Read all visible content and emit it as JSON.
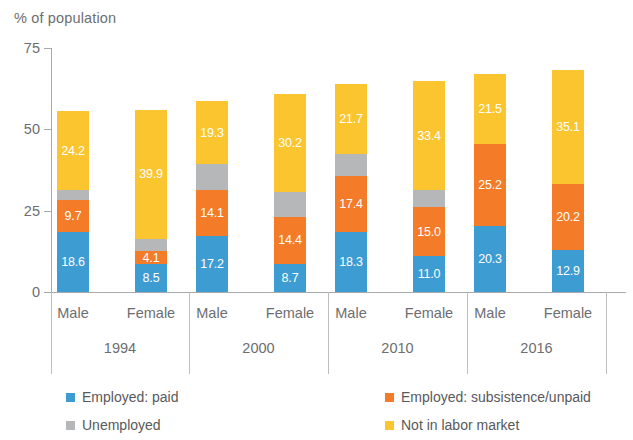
{
  "axis_title": "% of population",
  "legend": [
    {
      "label": "Employed: paid",
      "color": "#3d9cd2"
    },
    {
      "label": "Employed: subsistence/unpaid",
      "color": "#f47b28"
    },
    {
      "label": "Unemployed",
      "color": "#b5b7b9"
    },
    {
      "label": "Not in labor market",
      "color": "#fbc530"
    }
  ],
  "y_ticks": [
    "0",
    "25",
    "50",
    "75"
  ],
  "groups": [
    {
      "year": "1994",
      "subgroups": [
        "Male",
        "Female"
      ]
    },
    {
      "year": "2000",
      "subgroups": [
        "Male",
        "Female"
      ]
    },
    {
      "year": "2010",
      "subgroups": [
        "Male",
        "Female"
      ]
    },
    {
      "year": "2016",
      "subgroups": [
        "Male",
        "Female"
      ]
    }
  ],
  "chart_data": {
    "type": "bar",
    "title": "",
    "subtitle": "",
    "xlabel": "",
    "ylabel": "% of population",
    "ylim": [
      0,
      75
    ],
    "yticks": [
      0,
      25,
      50,
      75
    ],
    "grid": false,
    "stacked": true,
    "legend_position": "bottom",
    "categories": [
      "1994 Male",
      "1994 Female",
      "2000 Male",
      "2000 Female",
      "2010 Male",
      "2010 Female",
      "2016 Male",
      "2016 Female"
    ],
    "group_labels": [
      "1994",
      "2000",
      "2010",
      "2016"
    ],
    "subgroup_labels": [
      "Male",
      "Female"
    ],
    "series": [
      {
        "name": "Employed: paid",
        "color": "#3d9cd2",
        "values": [
          18.6,
          8.5,
          17.2,
          8.7,
          18.3,
          11.0,
          20.3,
          12.9
        ],
        "labels": [
          "18.6",
          "8.5",
          "17.2",
          "8.7",
          "18.3",
          "11.0",
          "20.3",
          "12.9"
        ]
      },
      {
        "name": "Employed: subsistence/unpaid",
        "color": "#f47b28",
        "values": [
          9.7,
          4.1,
          14.1,
          14.4,
          17.4,
          15.0,
          25.2,
          20.2
        ],
        "labels": [
          "9.7",
          "4.1",
          "14.1",
          "14.4",
          "17.4",
          "15.0",
          "25.2",
          "20.2"
        ]
      },
      {
        "name": "Unemployed",
        "color": "#b5b7b9",
        "values": [
          3.0,
          3.6,
          8.0,
          7.6,
          6.6,
          5.4,
          0.0,
          0.0
        ],
        "labels": [
          "",
          "",
          "",
          "",
          "",
          "",
          "",
          ""
        ]
      },
      {
        "name": "Not in labor market",
        "color": "#fbc530",
        "values": [
          24.2,
          39.9,
          19.3,
          30.2,
          21.7,
          33.4,
          21.5,
          35.1
        ],
        "labels": [
          "24.2",
          "39.9",
          "19.3",
          "30.2",
          "21.7",
          "33.4",
          "21.5",
          "35.1"
        ]
      }
    ],
    "totals": [
      55.5,
      56.1,
      58.6,
      60.9,
      64.0,
      64.8,
      67.0,
      68.2
    ]
  }
}
